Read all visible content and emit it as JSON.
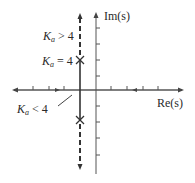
{
  "figure": {
    "type": "root-locus",
    "axes": {
      "x_label": "Re(s)",
      "y_label": "Im(s)"
    },
    "labels": {
      "ka_greater": {
        "var": "K",
        "sub": "a",
        "rel": " > 4"
      },
      "ka_equal": {
        "var": "K",
        "sub": "a",
        "rel": " = 4"
      },
      "ka_less": {
        "var": "K",
        "sub": "a",
        "rel": " < 4"
      }
    },
    "colors": {
      "ink": "#2a2a2a",
      "axis": "#555555"
    }
  }
}
